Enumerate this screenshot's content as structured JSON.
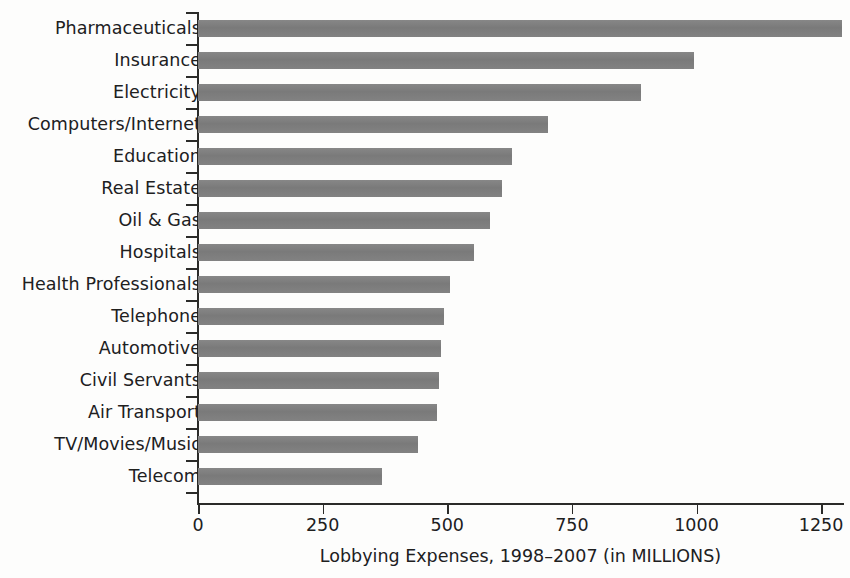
{
  "chart_data": {
    "type": "bar",
    "orientation": "horizontal",
    "title": "",
    "xlabel": "Lobbying Expenses, 1998–2007 (in MILLIONS)",
    "ylabel": "",
    "xlim": [
      0,
      1300
    ],
    "xticks": [
      0,
      250,
      500,
      750,
      1000,
      1250
    ],
    "xtick_labels": [
      "0",
      "250",
      "500",
      "750",
      "1000",
      "1250"
    ],
    "grid": false,
    "legend": null,
    "bar_color": "#7d7d7d",
    "axis_color": "#2b2b29",
    "background_color": "#fdfdfc",
    "categories": [
      "Pharmaceuticals",
      "Insurance",
      "Electricity",
      "Computers/Internet",
      "Education",
      "Real Estate",
      "Oil & Gas",
      "Hospitals",
      "Health Professionals",
      "Telephone",
      "Automotive",
      "Civil Servants",
      "Air Transport",
      "TV/Movies/Music",
      "Telecom"
    ],
    "values": [
      1292,
      995,
      889,
      703,
      630,
      610,
      585,
      553,
      505,
      494,
      487,
      484,
      480,
      442,
      370
    ]
  }
}
